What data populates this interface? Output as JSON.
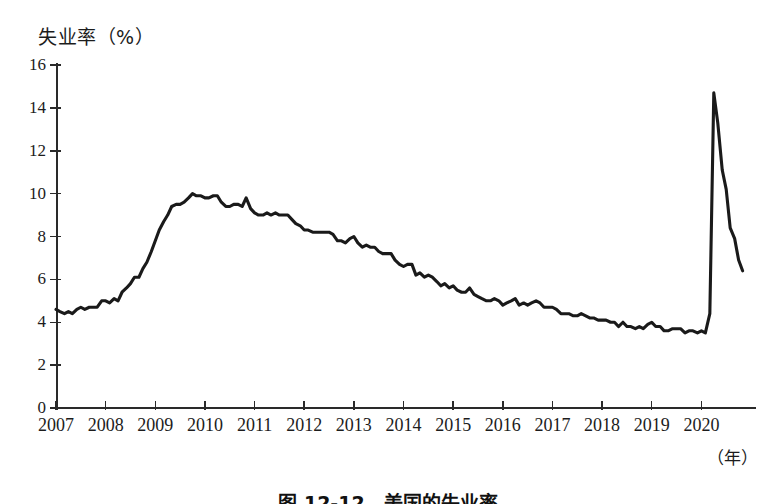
{
  "figure": {
    "caption": "图 12-12　美国的失业率",
    "y_axis_title": "失业率（%）",
    "x_axis_unit": "（年）"
  },
  "chart_data": {
    "type": "line",
    "title": "失业率（%）",
    "xlabel": "（年）",
    "ylabel": "失业率（%）",
    "xlim": [
      2007,
      2021.1
    ],
    "ylim": [
      0,
      16
    ],
    "grid": false,
    "legend": null,
    "y_ticks": [
      0,
      2,
      4,
      6,
      8,
      10,
      12,
      14,
      16
    ],
    "x_ticks": [
      2007,
      2008,
      2009,
      2010,
      2011,
      2012,
      2013,
      2014,
      2015,
      2016,
      2017,
      2018,
      2019,
      2020
    ],
    "x_tick_labels": [
      "2007",
      "2008",
      "2009",
      "2010",
      "2011",
      "2012",
      "2013",
      "2014",
      "2015",
      "2016",
      "2017",
      "2018",
      "2019",
      "2020"
    ],
    "series": [
      {
        "name": "美国失业率",
        "color": "#1a1a1a",
        "x": [
          2007.0,
          2007.08,
          2007.17,
          2007.25,
          2007.33,
          2007.42,
          2007.5,
          2007.58,
          2007.67,
          2007.75,
          2007.83,
          2007.92,
          2008.0,
          2008.08,
          2008.17,
          2008.25,
          2008.33,
          2008.42,
          2008.5,
          2008.58,
          2008.67,
          2008.75,
          2008.83,
          2008.92,
          2009.0,
          2009.08,
          2009.17,
          2009.25,
          2009.33,
          2009.42,
          2009.5,
          2009.58,
          2009.67,
          2009.75,
          2009.83,
          2009.92,
          2010.0,
          2010.08,
          2010.17,
          2010.25,
          2010.33,
          2010.42,
          2010.5,
          2010.58,
          2010.67,
          2010.75,
          2010.83,
          2010.92,
          2011.0,
          2011.08,
          2011.17,
          2011.25,
          2011.33,
          2011.42,
          2011.5,
          2011.58,
          2011.67,
          2011.75,
          2011.83,
          2011.92,
          2012.0,
          2012.08,
          2012.17,
          2012.25,
          2012.33,
          2012.42,
          2012.5,
          2012.58,
          2012.67,
          2012.75,
          2012.83,
          2012.92,
          2013.0,
          2013.08,
          2013.17,
          2013.25,
          2013.33,
          2013.42,
          2013.5,
          2013.58,
          2013.67,
          2013.75,
          2013.83,
          2013.92,
          2014.0,
          2014.08,
          2014.17,
          2014.25,
          2014.33,
          2014.42,
          2014.5,
          2014.58,
          2014.67,
          2014.75,
          2014.83,
          2014.92,
          2015.0,
          2015.08,
          2015.17,
          2015.25,
          2015.33,
          2015.42,
          2015.5,
          2015.58,
          2015.67,
          2015.75,
          2015.83,
          2015.92,
          2016.0,
          2016.08,
          2016.17,
          2016.25,
          2016.33,
          2016.42,
          2016.5,
          2016.58,
          2016.67,
          2016.75,
          2016.83,
          2016.92,
          2017.0,
          2017.08,
          2017.17,
          2017.25,
          2017.33,
          2017.42,
          2017.5,
          2017.58,
          2017.67,
          2017.75,
          2017.83,
          2017.92,
          2018.0,
          2018.08,
          2018.17,
          2018.25,
          2018.33,
          2018.42,
          2018.5,
          2018.58,
          2018.67,
          2018.75,
          2018.83,
          2018.92,
          2019.0,
          2019.08,
          2019.17,
          2019.25,
          2019.33,
          2019.42,
          2019.5,
          2019.58,
          2019.67,
          2019.75,
          2019.83,
          2019.92,
          2020.0,
          2020.08,
          2020.17,
          2020.25,
          2020.33,
          2020.42,
          2020.5,
          2020.58,
          2020.67,
          2020.75,
          2020.83
        ],
        "values": [
          4.6,
          4.5,
          4.4,
          4.5,
          4.4,
          4.6,
          4.7,
          4.6,
          4.7,
          4.7,
          4.7,
          5.0,
          5.0,
          4.9,
          5.1,
          5.0,
          5.4,
          5.6,
          5.8,
          6.1,
          6.1,
          6.5,
          6.8,
          7.3,
          7.8,
          8.3,
          8.7,
          9.0,
          9.4,
          9.5,
          9.5,
          9.6,
          9.8,
          10.0,
          9.9,
          9.9,
          9.8,
          9.8,
          9.9,
          9.9,
          9.6,
          9.4,
          9.4,
          9.5,
          9.5,
          9.4,
          9.8,
          9.3,
          9.1,
          9.0,
          9.0,
          9.1,
          9.0,
          9.1,
          9.0,
          9.0,
          9.0,
          8.8,
          8.6,
          8.5,
          8.3,
          8.3,
          8.2,
          8.2,
          8.2,
          8.2,
          8.2,
          8.1,
          7.8,
          7.8,
          7.7,
          7.9,
          8.0,
          7.7,
          7.5,
          7.6,
          7.5,
          7.5,
          7.3,
          7.2,
          7.2,
          7.2,
          6.9,
          6.7,
          6.6,
          6.7,
          6.7,
          6.2,
          6.3,
          6.1,
          6.2,
          6.1,
          5.9,
          5.7,
          5.8,
          5.6,
          5.7,
          5.5,
          5.4,
          5.4,
          5.6,
          5.3,
          5.2,
          5.1,
          5.0,
          5.0,
          5.1,
          5.0,
          4.8,
          4.9,
          5.0,
          5.1,
          4.8,
          4.9,
          4.8,
          4.9,
          5.0,
          4.9,
          4.7,
          4.7,
          4.7,
          4.6,
          4.4,
          4.4,
          4.4,
          4.3,
          4.3,
          4.4,
          4.3,
          4.2,
          4.2,
          4.1,
          4.1,
          4.1,
          4.0,
          4.0,
          3.8,
          4.0,
          3.8,
          3.8,
          3.7,
          3.8,
          3.7,
          3.9,
          4.0,
          3.8,
          3.8,
          3.6,
          3.6,
          3.7,
          3.7,
          3.7,
          3.5,
          3.6,
          3.6,
          3.5,
          3.6,
          3.5,
          4.4,
          14.7,
          13.3,
          11.1,
          10.2,
          8.4,
          7.9,
          6.9,
          6.4
        ]
      }
    ]
  }
}
